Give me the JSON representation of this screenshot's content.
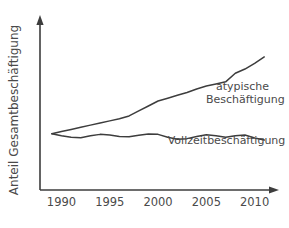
{
  "chart_data": {
    "type": "line",
    "title": "",
    "subtitle": "",
    "xlabel": "",
    "ylabel": "Anteil Gesamtbeschäftigung",
    "xlim": [
      1988.5,
      2011.5
    ],
    "ylim": [
      0,
      100
    ],
    "grid": false,
    "legend_position": "inline-right",
    "x_tick_labels": [
      "1990",
      "1995",
      "2000",
      "2005",
      "2010"
    ],
    "x_ticks": [
      1990,
      1995,
      2000,
      2005,
      2010
    ],
    "y_tick_labels": [],
    "axis_arrows": true,
    "annotations": [
      {
        "name": "atypische-label",
        "text_line1": "atypische",
        "text_line2": "Beschäftigung",
        "x": 2006.0,
        "y": 58
      },
      {
        "name": "vollzeit-label",
        "text_line1": "Vollzeitbeschäftigung",
        "text_line2": "",
        "x": 2001.0,
        "y": 20
      }
    ],
    "series": [
      {
        "name": "atypische Beschäftigung",
        "label": "atypische Beschäftigung",
        "color": "#3d3d3d",
        "x": [
          1989,
          1990,
          1991,
          1992,
          1993,
          1994,
          1995,
          1996,
          1997,
          1998,
          1999,
          2000,
          2001,
          2002,
          2003,
          2004,
          2005,
          2006,
          2007,
          2008,
          2009,
          2010,
          2011
        ],
        "values": [
          27.0,
          28.5,
          30.0,
          31.5,
          33.0,
          34.5,
          36.0,
          37.5,
          39.5,
          43.0,
          46.5,
          50.0,
          52.0,
          54.0,
          56.0,
          58.5,
          60.5,
          62.0,
          63.5,
          69.5,
          72.5,
          76.5,
          81.0
        ]
      },
      {
        "name": "Vollzeitbeschäftigung",
        "label": "Vollzeitbeschäftigung",
        "color": "#3d3d3d",
        "x": [
          1989,
          1990,
          1991,
          1992,
          1993,
          1994,
          1995,
          1996,
          1997,
          1998,
          1999,
          2000,
          2001,
          2002,
          2003,
          2004,
          2005,
          2006,
          2007,
          2008,
          2009,
          2010,
          2011
        ],
        "values": [
          27.0,
          25.5,
          24.5,
          24.2,
          25.5,
          26.5,
          26.0,
          25.0,
          24.8,
          25.8,
          26.8,
          26.5,
          24.5,
          23.0,
          23.5,
          25.0,
          26.2,
          25.5,
          24.5,
          25.5,
          26.0,
          24.0,
          22.5
        ]
      }
    ]
  },
  "geometry": {
    "plot_left": 47,
    "plot_right": 272,
    "plot_bottom": 190,
    "plot_top": 22,
    "y_axis_x": 40,
    "x_axis_y": 190,
    "x_min": 1988.5,
    "x_max": 2011.8,
    "y_min": 0,
    "y_max": 100,
    "y_pixel_at_zero": 172,
    "y_pixel_at_hundred": 30
  }
}
